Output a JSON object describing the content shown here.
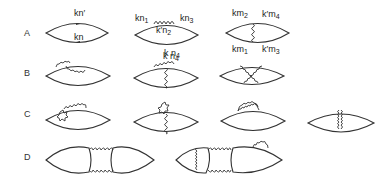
{
  "rows": [
    {
      "label": "A"
    },
    {
      "label": "B"
    },
    {
      "label": "C"
    },
    {
      "label": "D"
    }
  ],
  "diagrams": {
    "A1": {
      "top_label": "kn′",
      "bottom_label": "kn"
    },
    "A2": {
      "left_label": "kn",
      "left_sub": "1",
      "right_label": "kn",
      "right_sub": "3",
      "inner_label": "k′n",
      "inner_sub": "2",
      "below_label": "k n",
      "below_sub": "4"
    },
    "A3": {
      "tl_label": "km",
      "tl_sub": "2",
      "tr_label": "k′m",
      "tr_sub": "4",
      "bl_label": "km",
      "bl_sub": "1",
      "br_label": "k′m",
      "br_sub": "3"
    }
  },
  "colors": {
    "line": "#333333",
    "background": "#ffffff"
  }
}
